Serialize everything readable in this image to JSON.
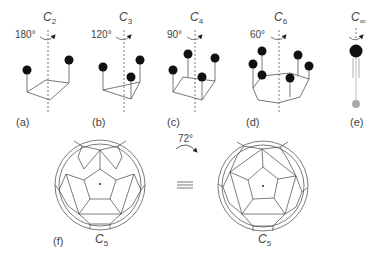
{
  "panels": [
    {
      "id": "a",
      "label": "(a)",
      "axis": "C",
      "axis_sub": "2",
      "angle": "180°"
    },
    {
      "id": "b",
      "label": "(b)",
      "axis": "C",
      "axis_sub": "3",
      "angle": "120°"
    },
    {
      "id": "c",
      "label": "(c)",
      "axis": "C",
      "axis_sub": "4",
      "angle": "90°"
    },
    {
      "id": "d",
      "label": "(d)",
      "axis": "C",
      "axis_sub": "6",
      "angle": "60°"
    },
    {
      "id": "e",
      "label": "(e)",
      "axis": "C",
      "axis_sub": "∞",
      "angle": ""
    }
  ],
  "bottom": {
    "label": "(f)",
    "rotation": "72°",
    "equiv": "≡",
    "left_axis": "C",
    "left_sub": "5",
    "right_axis": "C",
    "right_sub": "5"
  }
}
